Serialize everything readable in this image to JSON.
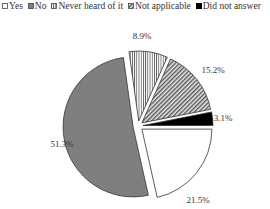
{
  "chart_data": {
    "type": "pie",
    "title": "",
    "categories": [
      "Yes",
      "No",
      "Never heard of it",
      "Not applicable",
      "Did not answer"
    ],
    "values": [
      21.5,
      51.3,
      8.9,
      15.2,
      3.1
    ],
    "labels": [
      "21.5%",
      "51.3%",
      "8.9%",
      "15.2%",
      "3.1%"
    ],
    "legend_position": "top",
    "exploded": true
  },
  "legend": {
    "items": [
      {
        "label": "Yes"
      },
      {
        "label": "No"
      },
      {
        "label": "Never heard of it"
      },
      {
        "label": "Not applicable"
      },
      {
        "label": "Did not answer"
      }
    ]
  }
}
